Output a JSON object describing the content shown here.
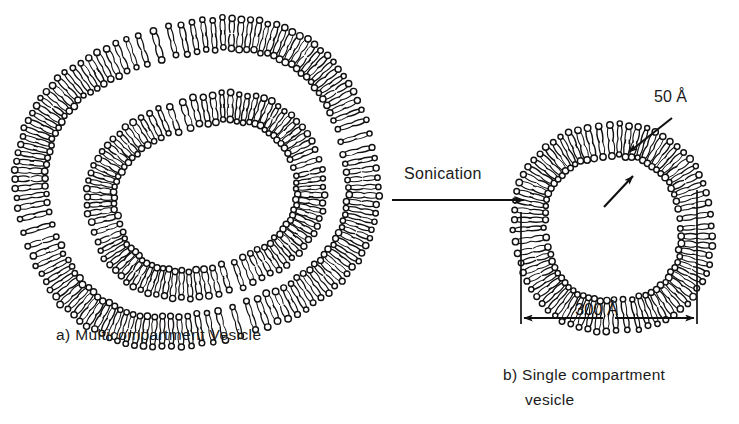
{
  "figure": {
    "background": "#ffffff",
    "ink": "#111111",
    "width": 739,
    "height": 424
  },
  "labels": {
    "caption_a": "a)  Multicompartment  Vesicle",
    "caption_b_line1": "b)  Single compartment",
    "caption_b_line2": "vesicle",
    "process": "Sonication",
    "thickness": "50 Å",
    "diameter": "300 Å"
  },
  "arrows": {
    "process_arrow": {
      "x1": 392,
      "y1": 200,
      "x2": 524,
      "y2": 200
    },
    "thickness_arrow": {
      "x1": 672,
      "y1": 118,
      "x2": 629,
      "y2": 152
    },
    "inner_leaflet_arrow": {
      "x1": 604,
      "y1": 207,
      "x2": 633,
      "y2": 176
    },
    "dimension_line": {
      "y": 318,
      "x_left": 521,
      "x_right": 697,
      "ext_left_top": 212,
      "ext_right_top": 190
    }
  },
  "structures": {
    "multicompartment": {
      "name": "multicompartment-vesicle",
      "shells": [
        {
          "name": "outer-shell",
          "cx": 197,
          "cy": 183,
          "rx": 164,
          "ry": 143,
          "rotation": -16,
          "thickness": 30,
          "lipids": 112,
          "squareness": 0.82
        },
        {
          "name": "inner-shell",
          "cx": 206,
          "cy": 196,
          "rx": 105,
          "ry": 84,
          "rotation": -18,
          "thickness": 27,
          "lipids": 78,
          "squareness": 0.86
        }
      ]
    },
    "single_compartment": {
      "name": "single-compartment-vesicle",
      "shells": [
        {
          "name": "bilayer-shell",
          "cx": 613,
          "cy": 228,
          "rx": 83,
          "ry": 88,
          "rotation": -8,
          "thickness": 31,
          "lipids": 68,
          "squareness": 0.88
        }
      ]
    }
  }
}
